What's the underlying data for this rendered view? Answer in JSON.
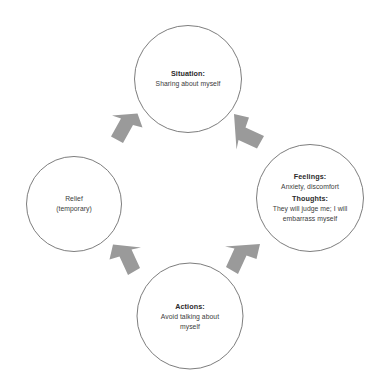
{
  "diagram": {
    "type": "cycle",
    "title": "",
    "background_color": "#ffffff",
    "circle_stroke_color": "#6e6e6e",
    "arrow_fill_color": "#9a9a9a",
    "text_color": "#3a3a3a",
    "flow_order": [
      "Situation",
      "Feelings / Thoughts",
      "Actions",
      "Relief (temporary)"
    ],
    "nodes": {
      "situation": {
        "heading": "Situation:",
        "body": "Sharing about myself"
      },
      "feelings": {
        "heading": "Feelings:",
        "body": "Anxiety, discomfort",
        "heading2": "Thoughts:",
        "body2": "They will judge me; I will embarrass myself"
      },
      "actions": {
        "heading": "Actions:",
        "body": "Avoid talking about myself"
      },
      "relief": {
        "line1": "Relief",
        "line2": "(temporary)"
      }
    },
    "arrows": [
      {
        "name": "relief-to-situation",
        "direction": "up-right"
      },
      {
        "name": "situation-to-feelings",
        "direction": "down-right"
      },
      {
        "name": "feelings-to-actions",
        "direction": "down-left"
      },
      {
        "name": "actions-to-relief",
        "direction": "up-left"
      }
    ]
  }
}
